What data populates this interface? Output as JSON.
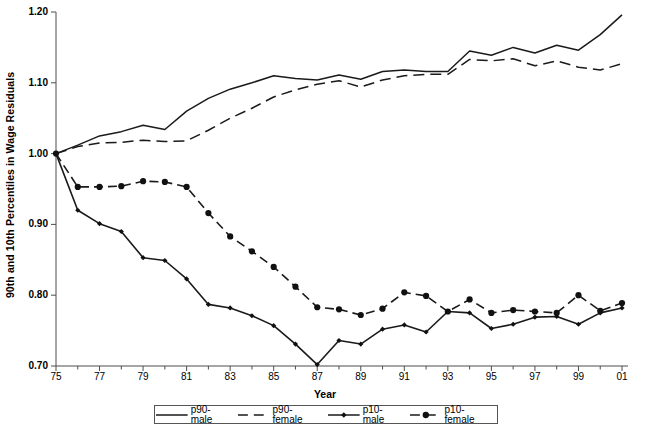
{
  "axes": {
    "ylabel": "90th and 10th Percentiles in Wage Residuals",
    "xlabel": "Year",
    "yticks": [
      "1.20",
      "1.10",
      "1.00",
      "0.90",
      "0.80",
      "0.70"
    ],
    "xticks": [
      "75",
      "77",
      "79",
      "81",
      "83",
      "85",
      "87",
      "89",
      "91",
      "93",
      "95",
      "97",
      "99",
      "01"
    ]
  },
  "legend": {
    "items": [
      {
        "label": "p90-male",
        "style": "solid",
        "marker": "none",
        "color": "#1a1a1a"
      },
      {
        "label": "p90-female",
        "style": "dashed",
        "marker": "none",
        "color": "#1a1a1a"
      },
      {
        "label": "p10-male",
        "style": "solid",
        "marker": "diamond",
        "color": "#1a1a1a"
      },
      {
        "label": "p10-female",
        "style": "dashed",
        "marker": "circle",
        "color": "#1a1a1a"
      }
    ]
  },
  "chart_data": {
    "type": "line",
    "title": "",
    "xlabel": "Year",
    "ylabel": "90th and 10th Percentiles in Wage Residuals",
    "xlim": [
      1975,
      2001
    ],
    "ylim": [
      0.7,
      1.2
    ],
    "ytick_values": [
      0.7,
      0.8,
      0.9,
      1.0,
      1.1,
      1.2
    ],
    "xtick_values": [
      1975,
      1977,
      1979,
      1981,
      1983,
      1985,
      1987,
      1989,
      1991,
      1993,
      1995,
      1997,
      1999,
      2001
    ],
    "xtick_labels": [
      "75",
      "77",
      "79",
      "81",
      "83",
      "85",
      "87",
      "89",
      "91",
      "93",
      "95",
      "97",
      "99",
      "01"
    ],
    "grid": false,
    "legend_position": "below",
    "x": [
      1975,
      1976,
      1977,
      1978,
      1979,
      1980,
      1981,
      1982,
      1983,
      1984,
      1985,
      1986,
      1987,
      1988,
      1989,
      1990,
      1991,
      1992,
      1993,
      1994,
      1995,
      1996,
      1997,
      1998,
      1999,
      2000,
      2001
    ],
    "series": [
      {
        "name": "p90-male",
        "style": "solid",
        "marker": "none",
        "values": [
          1.0,
          1.012,
          1.025,
          1.031,
          1.04,
          1.034,
          1.06,
          1.078,
          1.091,
          1.1,
          1.11,
          1.106,
          1.104,
          1.111,
          1.105,
          1.116,
          1.118,
          1.116,
          1.116,
          1.145,
          1.139,
          1.15,
          1.142,
          1.153,
          1.146,
          1.168,
          1.196
        ]
      },
      {
        "name": "p90-female",
        "style": "dashed",
        "marker": "none",
        "values": [
          1.0,
          1.01,
          1.015,
          1.016,
          1.019,
          1.017,
          1.018,
          1.033,
          1.05,
          1.064,
          1.08,
          1.09,
          1.098,
          1.103,
          1.094,
          1.104,
          1.11,
          1.112,
          1.112,
          1.133,
          1.131,
          1.134,
          1.124,
          1.131,
          1.122,
          1.118,
          1.127
        ]
      },
      {
        "name": "p10-male",
        "style": "solid",
        "marker": "diamond",
        "values": [
          1.0,
          0.92,
          0.901,
          0.89,
          0.853,
          0.849,
          0.823,
          0.787,
          0.782,
          0.771,
          0.757,
          0.731,
          0.702,
          0.736,
          0.731,
          0.752,
          0.758,
          0.748,
          0.777,
          0.775,
          0.753,
          0.759,
          0.769,
          0.77,
          0.759,
          0.775,
          0.782
        ]
      },
      {
        "name": "p10-female",
        "style": "dashed",
        "marker": "circle",
        "values": [
          1.0,
          0.953,
          0.953,
          0.954,
          0.961,
          0.96,
          0.953,
          0.916,
          0.883,
          0.862,
          0.84,
          0.812,
          0.783,
          0.78,
          0.772,
          0.781,
          0.804,
          0.799,
          0.777,
          0.794,
          0.775,
          0.779,
          0.777,
          0.775,
          0.8,
          0.778,
          0.789
        ]
      }
    ]
  }
}
